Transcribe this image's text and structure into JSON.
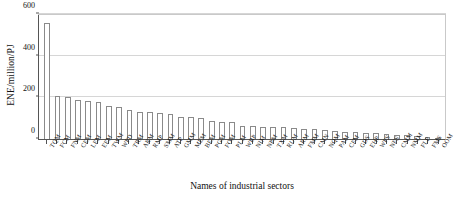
{
  "chart_data": {
    "type": "bar",
    "title": "",
    "xlabel": "Names of industrial sectors",
    "ylabel": "ENE/million/PJ",
    "ylim": [
      0,
      600
    ],
    "yticks": [
      0,
      200,
      400,
      600
    ],
    "ytick_labels": [
      "0",
      "200",
      "400",
      "600"
    ],
    "grid": true,
    "legend": "none",
    "bar_style": {
      "fill": "#ffffff",
      "edge": "#8a8a8a"
    },
    "categories": [
      "TQM",
      "FCM",
      "FNM",
      "CEM",
      "LEM",
      "EEM",
      "TWM",
      "WPD",
      "TRM",
      "ARM",
      "RMP",
      "SMM",
      "ATP",
      "GMM",
      "MEM",
      "BEM",
      "PGM",
      "FOM",
      "PLM",
      "WBP",
      "NIM",
      "NPM",
      "TXM",
      "RUM",
      "ARM2",
      "FMM",
      "CMN",
      "NQM",
      "PAM",
      "CFM",
      "GDS",
      "EHP",
      "WPS",
      "NFS",
      "CMM",
      "NMM",
      "FLP",
      "FMS",
      "OOM"
    ],
    "values": [
      555,
      205,
      200,
      186,
      183,
      180,
      160,
      155,
      140,
      132,
      128,
      124,
      120,
      108,
      104,
      100,
      86,
      84,
      80,
      64,
      62,
      60,
      58,
      56,
      52,
      50,
      46,
      42,
      40,
      36,
      33,
      30,
      27,
      24,
      21,
      18,
      14,
      10,
      6
    ]
  }
}
